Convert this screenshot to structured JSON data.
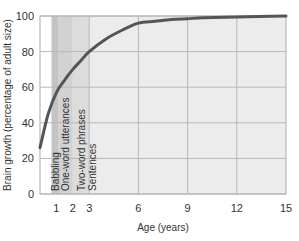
{
  "chart_data": {
    "type": "line",
    "title": "",
    "xlabel": "Age (years)",
    "ylabel": "Brain growth (percentage of adult size)",
    "xlim": [
      0,
      15
    ],
    "ylim": [
      0,
      100
    ],
    "x_ticks": [
      1,
      2,
      3,
      6,
      9,
      12,
      15
    ],
    "y_ticks": [
      0,
      20,
      40,
      60,
      80,
      100
    ],
    "grid": true,
    "legend": null,
    "series": [
      {
        "name": "Brain growth",
        "x": [
          0,
          0.5,
          1,
          1.5,
          2,
          2.5,
          3,
          4,
          5,
          6,
          7,
          8,
          9,
          10,
          12,
          15
        ],
        "y": [
          26,
          45,
          57,
          64,
          70,
          75,
          80,
          87,
          92,
          96,
          97,
          98,
          98.5,
          99,
          99.5,
          100
        ]
      }
    ],
    "annotations": [
      {
        "label": "Babbling",
        "x_start": 0.7,
        "x_end": 1.1
      },
      {
        "label": "One-word utterances",
        "x_start": 1.1,
        "x_end": 2.0
      },
      {
        "label": "Two-word phrases",
        "x_start": 2.0,
        "x_end": 3.0
      },
      {
        "label": "Sentences",
        "x_start": 3.0,
        "x_end": 15.0
      }
    ],
    "colors": {
      "line": "#555555",
      "band_babbling": "#c4c4c4",
      "band_one_word": "#d2d2d2",
      "band_two_word": "#dcdcdc",
      "band_sentences": "#ececec",
      "grid": "#b8b8b8"
    }
  }
}
